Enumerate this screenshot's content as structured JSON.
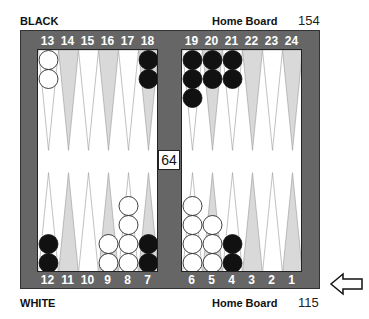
{
  "top": {
    "player_label": "BLACK",
    "home_board_label": "Home Board",
    "pip_count": "154"
  },
  "bottom": {
    "player_label": "WHITE",
    "home_board_label": "Home Board",
    "pip_count": "115"
  },
  "point_numbers": {
    "top_left": [
      "13",
      "14",
      "15",
      "16",
      "17",
      "18"
    ],
    "top_right": [
      "19",
      "20",
      "21",
      "22",
      "23",
      "24"
    ],
    "bottom_left": [
      "12",
      "11",
      "10",
      "9",
      "8",
      "7"
    ],
    "bottom_right": [
      "6",
      "5",
      "4",
      "3",
      "2",
      "1"
    ]
  },
  "doubling_cube": {
    "value": "64"
  },
  "turn_indicator": {
    "icon": "arrow-left-icon",
    "side": "white"
  },
  "colors": {
    "frame": "#666666",
    "light_point": "#d9d9d9",
    "dark_point": "#ffffff",
    "black_checker": "#111111",
    "white_checker": "#ffffff"
  },
  "positions": {
    "13": {
      "color": "white",
      "count": 2
    },
    "18": {
      "color": "black",
      "count": 2
    },
    "19": {
      "color": "black",
      "count": 3
    },
    "20": {
      "color": "black",
      "count": 2
    },
    "21": {
      "color": "black",
      "count": 2
    },
    "12": {
      "color": "black",
      "count": 2
    },
    "9": {
      "color": "white",
      "count": 2
    },
    "8": {
      "color": "white",
      "count": 4
    },
    "7": {
      "color": "black",
      "count": 2
    },
    "6": {
      "color": "white",
      "count": 4
    },
    "5": {
      "color": "white",
      "count": 3
    },
    "4": {
      "color": "black",
      "count": 2
    }
  }
}
